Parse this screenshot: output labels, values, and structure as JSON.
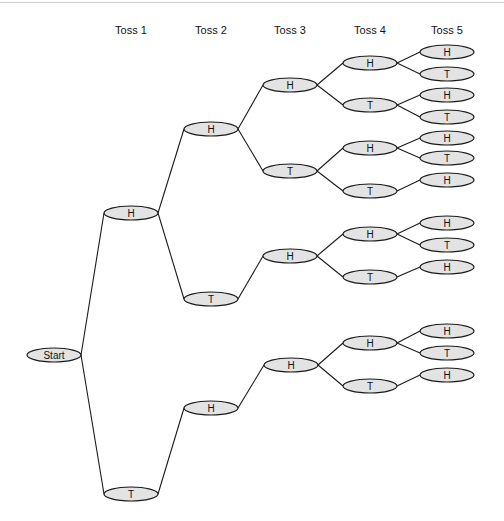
{
  "diagram": {
    "type": "tree",
    "title": "",
    "columns": [
      {
        "label": "Toss 1",
        "x": 131
      },
      {
        "label": "Toss 2",
        "x": 211
      },
      {
        "label": "Toss 3",
        "x": 290
      },
      {
        "label": "Toss 4",
        "x": 370
      },
      {
        "label": "Toss 5",
        "x": 447
      }
    ],
    "column_label_y": 34,
    "node_rx": 27,
    "node_ry": 7,
    "nodes": [
      {
        "id": "start",
        "label": "Start",
        "x": 54,
        "y": 355
      },
      {
        "id": "t1H",
        "label": "H",
        "x": 131,
        "y": 213,
        "parent": "start"
      },
      {
        "id": "t1T",
        "label": "T",
        "x": 131,
        "y": 494,
        "parent": "start"
      },
      {
        "id": "t2HH",
        "label": "H",
        "x": 211,
        "y": 129,
        "parent": "t1H"
      },
      {
        "id": "t2HT",
        "label": "T",
        "x": 211,
        "y": 299,
        "parent": "t1H"
      },
      {
        "id": "t2TH",
        "label": "H",
        "x": 211,
        "y": 408,
        "parent": "t1T"
      },
      {
        "id": "t3HHH",
        "label": "H",
        "x": 290,
        "y": 85,
        "parent": "t2HH"
      },
      {
        "id": "t3HHT",
        "label": "T",
        "x": 290,
        "y": 171,
        "parent": "t2HH"
      },
      {
        "id": "t3HTH",
        "label": "H",
        "x": 290,
        "y": 256,
        "parent": "t2HT"
      },
      {
        "id": "t3THH",
        "label": "H",
        "x": 291,
        "y": 365,
        "parent": "t2TH"
      },
      {
        "id": "t4a",
        "label": "H",
        "x": 370,
        "y": 63,
        "parent": "t3HHH"
      },
      {
        "id": "t4b",
        "label": "T",
        "x": 370,
        "y": 105,
        "parent": "t3HHH"
      },
      {
        "id": "t4c",
        "label": "H",
        "x": 370,
        "y": 148,
        "parent": "t3HHT"
      },
      {
        "id": "t4d",
        "label": "T",
        "x": 370,
        "y": 191,
        "parent": "t3HHT"
      },
      {
        "id": "t4e",
        "label": "H",
        "x": 370,
        "y": 234,
        "parent": "t3HTH"
      },
      {
        "id": "t4f",
        "label": "T",
        "x": 370,
        "y": 277,
        "parent": "t3HTH"
      },
      {
        "id": "t4g",
        "label": "H",
        "x": 370,
        "y": 343,
        "parent": "t3THH"
      },
      {
        "id": "t4h",
        "label": "T",
        "x": 370,
        "y": 386,
        "parent": "t3THH"
      },
      {
        "id": "t5a",
        "label": "H",
        "x": 447,
        "y": 52,
        "parent": "t4a"
      },
      {
        "id": "t5b",
        "label": "T",
        "x": 447,
        "y": 74,
        "parent": "t4a"
      },
      {
        "id": "t5c",
        "label": "H",
        "x": 447,
        "y": 95,
        "parent": "t4b"
      },
      {
        "id": "t5d",
        "label": "T",
        "x": 447,
        "y": 117,
        "parent": "t4b"
      },
      {
        "id": "t5e",
        "label": "H",
        "x": 447,
        "y": 138,
        "parent": "t4c"
      },
      {
        "id": "t5f",
        "label": "T",
        "x": 447,
        "y": 158,
        "parent": "t4c"
      },
      {
        "id": "t5g",
        "label": "H",
        "x": 447,
        "y": 180,
        "parent": "t4d"
      },
      {
        "id": "t5h",
        "label": "H",
        "x": 447,
        "y": 223,
        "parent": "t4e"
      },
      {
        "id": "t5i",
        "label": "T",
        "x": 447,
        "y": 245,
        "parent": "t4e"
      },
      {
        "id": "t5j",
        "label": "H",
        "x": 447,
        "y": 267,
        "parent": "t4f"
      },
      {
        "id": "t5k",
        "label": "H",
        "x": 447,
        "y": 331,
        "parent": "t4g"
      },
      {
        "id": "t5l",
        "label": "T",
        "x": 447,
        "y": 353,
        "parent": "t4g"
      },
      {
        "id": "t5m",
        "label": "H",
        "x": 447,
        "y": 375,
        "parent": "t4h"
      }
    ]
  }
}
